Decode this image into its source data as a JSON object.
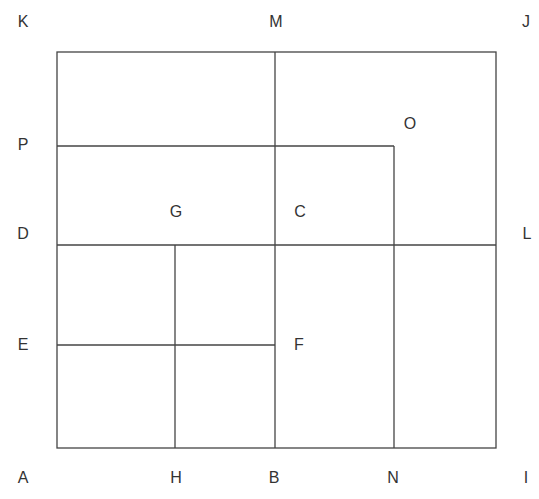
{
  "diagram": {
    "type": "rectangle-partition",
    "line_color": "#444444",
    "label_color": "#333333",
    "outer_box": {
      "x1": 57,
      "y1": 52,
      "x2": 496,
      "y2": 448
    },
    "lines": [
      {
        "id": "M-B",
        "x1": 275,
        "y1": 52,
        "x2": 275,
        "y2": 448
      },
      {
        "id": "P-line",
        "x1": 57,
        "y1": 146,
        "x2": 394,
        "y2": 146
      },
      {
        "id": "N-line",
        "x1": 394,
        "y1": 146,
        "x2": 394,
        "y2": 448
      },
      {
        "id": "D-L",
        "x1": 57,
        "y1": 245,
        "x2": 496,
        "y2": 245
      },
      {
        "id": "H-line",
        "x1": 175,
        "y1": 245,
        "x2": 175,
        "y2": 448
      },
      {
        "id": "E-F",
        "x1": 57,
        "y1": 345,
        "x2": 275,
        "y2": 345
      }
    ],
    "labels": [
      {
        "text": "K",
        "x": 23,
        "y": 22
      },
      {
        "text": "M",
        "x": 276,
        "y": 22
      },
      {
        "text": "J",
        "x": 526,
        "y": 22
      },
      {
        "text": "O",
        "x": 410,
        "y": 124
      },
      {
        "text": "P",
        "x": 23,
        "y": 145
      },
      {
        "text": "G",
        "x": 176,
        "y": 212
      },
      {
        "text": "C",
        "x": 300,
        "y": 212
      },
      {
        "text": "D",
        "x": 23,
        "y": 234
      },
      {
        "text": "L",
        "x": 527,
        "y": 234
      },
      {
        "text": "E",
        "x": 23,
        "y": 345
      },
      {
        "text": "F",
        "x": 299,
        "y": 345
      },
      {
        "text": "A",
        "x": 23,
        "y": 478
      },
      {
        "text": "H",
        "x": 176,
        "y": 478
      },
      {
        "text": "B",
        "x": 274,
        "y": 478
      },
      {
        "text": "N",
        "x": 393,
        "y": 478
      },
      {
        "text": "I",
        "x": 526,
        "y": 478
      }
    ]
  }
}
